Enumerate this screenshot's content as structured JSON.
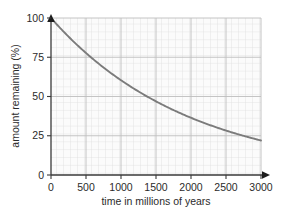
{
  "chart_data": {
    "type": "line",
    "title": "",
    "xlabel": "time in millions of years",
    "ylabel": "amount remaining (%)",
    "xlim": [
      0,
      3000
    ],
    "ylim": [
      0,
      100
    ],
    "xticks": [
      0,
      500,
      1000,
      1500,
      2000,
      2500,
      3000
    ],
    "xtick_labels": [
      "0",
      "500",
      "1000",
      "1500",
      "2000",
      "2500",
      "3000"
    ],
    "yticks": [
      0,
      25,
      50,
      75,
      100
    ],
    "ytick_labels": [
      "0",
      "25",
      "50",
      "75",
      "100"
    ],
    "grid": true,
    "grid_minor_step_x": 100,
    "grid_minor_step_y": 5,
    "legend": "none",
    "series": [
      {
        "name": "amount remaining",
        "color": "#7b7b7b",
        "x": [
          0,
          100,
          200,
          300,
          400,
          500,
          600,
          700,
          800,
          900,
          1000,
          1100,
          1200,
          1300,
          1400,
          1500,
          1600,
          1700,
          1800,
          1900,
          2000,
          2100,
          2200,
          2300,
          2400,
          2500,
          2600,
          2700,
          2800,
          2900,
          3000
        ],
        "y": [
          100.0,
          96.6,
          93.3,
          90.1,
          87.1,
          84.1,
          81.2,
          78.5,
          75.8,
          73.2,
          70.7,
          68.3,
          66.0,
          63.8,
          61.6,
          59.5,
          57.5,
          55.5,
          53.6,
          51.8,
          50.0,
          48.3,
          46.7,
          45.1,
          43.6,
          42.1,
          40.6,
          39.2,
          37.9,
          36.6,
          35.4
        ]
      }
    ],
    "curve_description": "exponential decay from 100% at 0 My to about 22% at 3000 My",
    "curve_endpoints": {
      "start_value": 100,
      "end_value": 22
    },
    "axis_arrow_x": "arrow at right end of x-axis",
    "axis_arrow_y": "arrow at top end of y-axis"
  },
  "colors": {
    "curve": "#7b7b7b",
    "axis": "#3a3a3a",
    "grid_minor": "#d8d8d8",
    "grid_major": "#bdbdbd",
    "plot_background": "#fbfbfb",
    "text": "#2b2b2b"
  }
}
